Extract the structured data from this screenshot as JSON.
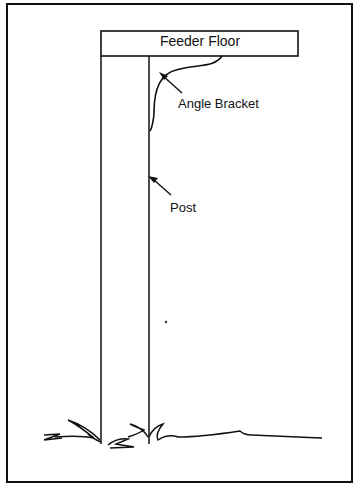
{
  "figure": {
    "labels": {
      "floor": "Feeder Floor",
      "bracket": "Angle Bracket",
      "post": "Post"
    },
    "colors": {
      "line": "#111111",
      "background": "#ffffff"
    }
  }
}
